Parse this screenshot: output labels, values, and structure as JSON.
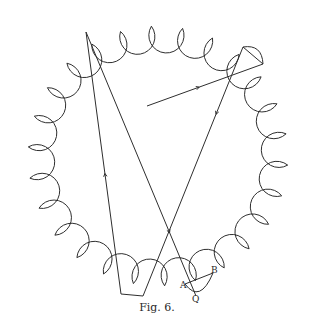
{
  "figure": {
    "caption": "Fig. 6.",
    "stroke_color": "#2e2e2e",
    "background": "#ffffff"
  },
  "outline": {
    "type": "scalloped-circle",
    "center": [
      158,
      156
    ],
    "junction_radius": 130,
    "scallop_count": 26,
    "rotation_deg": 4
  },
  "rays": [
    {
      "name": "incident-ray",
      "points": [
        [
          147,
          106
        ],
        [
          263,
          64
        ]
      ],
      "arrow_at": 0.45
    },
    {
      "name": "reflection-1",
      "points": [
        [
          263,
          64
        ],
        [
          243,
          47
        ]
      ]
    },
    {
      "name": "descending-right",
      "points": [
        [
          243,
          47
        ],
        [
          143,
          296
        ]
      ],
      "arrow_at": 0.27
    },
    {
      "name": "bottom-chord-1",
      "points": [
        [
          143,
          296
        ],
        [
          121,
          294
        ]
      ]
    },
    {
      "name": "ascending-left",
      "points": [
        [
          121,
          294
        ],
        [
          86,
          32
        ]
      ],
      "arrow_at": 0.46
    },
    {
      "name": "descending-long",
      "points": [
        [
          86,
          32
        ],
        [
          196,
          296
        ]
      ],
      "arrow_at": 0.76
    },
    {
      "name": "segment-AB",
      "points": [
        [
          185,
          284
        ],
        [
          213,
          273
        ]
      ]
    }
  ],
  "labels": [
    {
      "text": "A",
      "x": 180,
      "y": 288
    },
    {
      "text": "B",
      "x": 211,
      "y": 273
    },
    {
      "text": "Q",
      "x": 194,
      "y": 300
    }
  ]
}
